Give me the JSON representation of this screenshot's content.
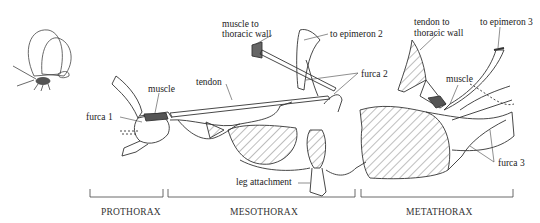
{
  "figure": {
    "labels": {
      "furca1": "furca 1",
      "muscle_pro": "muscle",
      "tendon": "tendon",
      "muscle_to_wall_line1": "muscle to",
      "muscle_to_wall_line2": "thoracic wall",
      "to_epimeron2": "to epimeron 2",
      "furca2": "furca 2",
      "leg_attachment": "leg attachment",
      "tendon_to_wall_line1": "tendon to",
      "tendon_to_wall_line2": "thoracic wall",
      "to_epimeron3": "to epimeron 3",
      "muscle_meta": "muscle",
      "furca3": "furca 3"
    },
    "segments": [
      {
        "name": "PROTHORAX",
        "x_start": 90,
        "x_end": 163
      },
      {
        "name": "MESOTHORAX",
        "x_start": 168,
        "x_end": 355
      },
      {
        "name": "METATHORAX",
        "x_start": 361,
        "x_end": 513
      }
    ],
    "colors": {
      "ink": "#222222",
      "background": "#ffffff"
    }
  }
}
